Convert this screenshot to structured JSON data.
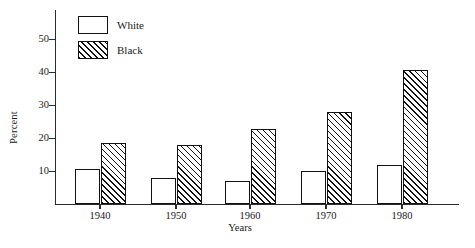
{
  "chart_data": {
    "type": "bar",
    "title": "",
    "xlabel": "Years",
    "ylabel": "Percent",
    "categories": [
      "1940",
      "1950",
      "1960",
      "1970",
      "1980"
    ],
    "series": [
      {
        "name": "White",
        "values": [
          10.5,
          8,
          7,
          10,
          11.8
        ],
        "fill": "open"
      },
      {
        "name": "Black",
        "values": [
          18.5,
          18,
          22.8,
          28,
          40.5
        ],
        "fill": "hatched"
      }
    ],
    "ylim": [
      0,
      57
    ],
    "yticks": [
      10,
      20,
      30,
      40,
      50
    ],
    "ytick_labels": [
      "10",
      "20",
      "30",
      "40",
      "50"
    ],
    "grid": false,
    "legend_position": "top-left",
    "colors": {
      "line": "#111111",
      "background": "#ffffff"
    }
  },
  "legend": {
    "items": [
      {
        "label": "White",
        "fill": "open"
      },
      {
        "label": "Black",
        "fill": "hatched"
      }
    ]
  }
}
